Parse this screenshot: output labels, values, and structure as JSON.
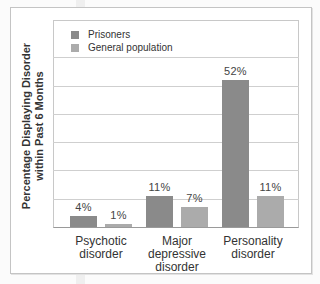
{
  "chart_data": {
    "type": "bar",
    "title": "",
    "xlabel": "",
    "ylabel": "Percentage Displaying Disorder within Past 6 Months",
    "ylabel_lines": [
      "Percentage Displaying Disorder",
      "within Past 6 Months"
    ],
    "categories": [
      "Psychotic disorder",
      "Major depressive disorder",
      "Personality disorder"
    ],
    "category_lines": [
      [
        "Psychotic",
        "disorder"
      ],
      [
        "Major",
        "depressive",
        "disorder"
      ],
      [
        "Personality",
        "disorder"
      ]
    ],
    "series": [
      {
        "name": "Prisoners",
        "values": [
          4,
          11,
          52
        ],
        "labels": [
          "4%",
          "11%",
          "52%"
        ],
        "color": "#8a8a8a"
      },
      {
        "name": "General population",
        "values": [
          1,
          7,
          11
        ],
        "labels": [
          "1%",
          "7%",
          "11%"
        ],
        "color": "#ababab"
      }
    ],
    "ylim": [
      0,
      70
    ],
    "grid": true,
    "gridline_step": 10,
    "legend_position": "top-left inside",
    "y_tick_labels_shown": false
  },
  "legend": {
    "items": [
      {
        "label": "Prisoners",
        "color": "#8a8a8a"
      },
      {
        "label": "General population",
        "color": "#ababab"
      }
    ]
  }
}
